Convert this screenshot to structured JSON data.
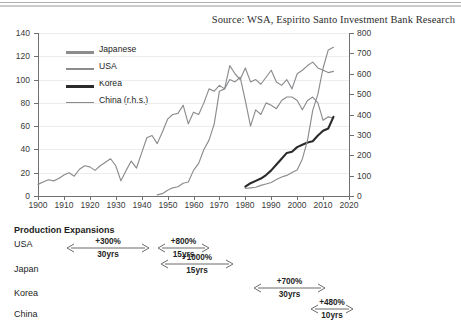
{
  "source_note": "Source: WSA, Espirito Santo Investment Bank Research",
  "legend": {
    "items": [
      {
        "label": "Japanese",
        "color": "#8a8c8e",
        "width": 2.6
      },
      {
        "label": "USA",
        "color": "#8a8c8e",
        "width": 1.7
      },
      {
        "label": "Korea",
        "color": "#2b2b2b",
        "width": 3.0
      },
      {
        "label": "China (r.h.s.)",
        "color": "#8a8c8e",
        "width": 1.7
      }
    ]
  },
  "annotations": {
    "title": "Production Expansions",
    "rows": [
      {
        "name": "USA"
      },
      {
        "name": "Japan"
      },
      {
        "name": "Korea"
      },
      {
        "name": "China"
      }
    ],
    "arrows": [
      {
        "series": "USA",
        "pct": "+300%",
        "yrs": "30yrs",
        "x": 66,
        "y": 248,
        "w": 84
      },
      {
        "series": "USA",
        "pct": "+800%",
        "yrs": "15yrs",
        "x": 157,
        "y": 248,
        "w": 53
      },
      {
        "series": "Japan",
        "pct": "+1000%",
        "yrs": "15yrs",
        "x": 160,
        "y": 264,
        "w": 74
      },
      {
        "series": "Korea",
        "pct": "+700%",
        "yrs": "30yrs",
        "x": 253,
        "y": 288,
        "w": 73
      },
      {
        "series": "China",
        "pct": "+480%",
        "yrs": "10yrs",
        "x": 310,
        "y": 309,
        "w": 44
      }
    ]
  },
  "chart_data": {
    "type": "line",
    "title": "",
    "xlabel": "",
    "ylabel": "",
    "y_left_label": "",
    "y_right_label": "",
    "xlim": [
      1900,
      2020
    ],
    "ylim_left": [
      0,
      140
    ],
    "ylim_right": [
      0,
      800
    ],
    "x_ticks": [
      1900,
      1910,
      1920,
      1930,
      1940,
      1950,
      1960,
      1970,
      1980,
      1990,
      2000,
      2010,
      2020
    ],
    "y_ticks_left": [
      0,
      20,
      40,
      60,
      80,
      100,
      120,
      140
    ],
    "y_ticks_right": [
      0,
      100,
      200,
      300,
      400,
      500,
      600,
      700,
      800
    ],
    "grid": true,
    "legend_position": "upper-left-inside",
    "series": [
      {
        "name": "USA",
        "axis": "left",
        "color": "#8a8c8e",
        "x": [
          1900,
          1902,
          1904,
          1906,
          1908,
          1910,
          1912,
          1914,
          1916,
          1918,
          1920,
          1922,
          1924,
          1926,
          1928,
          1930,
          1932,
          1934,
          1936,
          1938,
          1940,
          1942,
          1944,
          1946,
          1948,
          1950,
          1952,
          1954,
          1956,
          1958,
          1960,
          1962,
          1964,
          1966,
          1968,
          1970,
          1972,
          1974,
          1976,
          1978,
          1980,
          1982,
          1984,
          1986,
          1988,
          1990,
          1992,
          1994,
          1996,
          1998,
          2000,
          2002,
          2004,
          2006,
          2008,
          2010,
          2012,
          2014
        ],
        "values": [
          10,
          12,
          14,
          13,
          15,
          18,
          20,
          17,
          23,
          26,
          25,
          22,
          26,
          29,
          32,
          26,
          13,
          22,
          30,
          24,
          37,
          50,
          52,
          45,
          55,
          66,
          70,
          71,
          78,
          62,
          72,
          70,
          80,
          92,
          90,
          95,
          92,
          100,
          98,
          102,
          82,
          60,
          74,
          70,
          80,
          78,
          75,
          82,
          85,
          85,
          82,
          74,
          82,
          85,
          80,
          65,
          68,
          67
        ]
      },
      {
        "name": "Japanese",
        "axis": "left",
        "color": "#8a8c8e",
        "x": [
          1946,
          1948,
          1950,
          1952,
          1954,
          1956,
          1958,
          1960,
          1962,
          1964,
          1966,
          1968,
          1970,
          1972,
          1974,
          1976,
          1978,
          1980,
          1982,
          1984,
          1986,
          1988,
          1990,
          1992,
          1994,
          1996,
          1998,
          2000,
          2002,
          2004,
          2006,
          2008,
          2010,
          2012,
          2014
        ],
        "values": [
          1,
          2,
          5,
          7,
          8,
          11,
          12,
          22,
          28,
          40,
          48,
          62,
          90,
          92,
          112,
          105,
          100,
          110,
          98,
          100,
          96,
          102,
          108,
          98,
          95,
          100,
          92,
          105,
          108,
          112,
          115,
          110,
          108,
          106,
          107
        ]
      },
      {
        "name": "Korea",
        "axis": "left",
        "color": "#2b2b2b",
        "x": [
          1980,
          1982,
          1984,
          1986,
          1988,
          1990,
          1992,
          1994,
          1996,
          1998,
          2000,
          2002,
          2004,
          2006,
          2008,
          2010,
          2012,
          2014
        ],
        "values": [
          8,
          11,
          13,
          15,
          18,
          22,
          27,
          32,
          37,
          38,
          42,
          44,
          46,
          47,
          52,
          56,
          58,
          68
        ]
      },
      {
        "name": "China (r.h.s.)",
        "axis": "right",
        "color": "#8a8c8e",
        "x": [
          1980,
          1982,
          1984,
          1986,
          1988,
          1990,
          1992,
          1994,
          1996,
          1998,
          2000,
          2002,
          2004,
          2006,
          2008,
          2010,
          2012,
          2014
        ],
        "values": [
          37,
          40,
          43,
          52,
          59,
          66,
          81,
          93,
          101,
          115,
          128,
          182,
          273,
          420,
          500,
          627,
          717,
          730
        ]
      }
    ]
  }
}
